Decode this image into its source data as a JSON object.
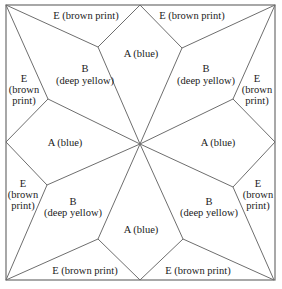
{
  "diagram": {
    "pieces": {
      "A": {
        "letter": "A",
        "color_name": "blue"
      },
      "B": {
        "letter": "B",
        "color_name": "deep yellow"
      },
      "E": {
        "letter": "E",
        "color_name": "brown print"
      }
    },
    "labels": {
      "e_top_left": "E (brown print)",
      "e_top_right": "E (brown print)",
      "a_top": "A (blue)",
      "b_top_left_letter": "B",
      "b_top_left_color": "(deep yellow)",
      "b_top_right_letter": "B",
      "b_top_right_color": "(deep yellow)",
      "e_left_top_letter": "E",
      "e_left_top_l1": "(brown",
      "e_left_top_l2": "print)",
      "e_right_top_letter": "E",
      "e_right_top_l1": "(brown",
      "e_right_top_l2": "print)",
      "a_left": "A (blue)",
      "a_right": "A (blue)",
      "e_left_bottom_letter": "E",
      "e_left_bottom_l1": "(brown",
      "e_left_bottom_l2": "print)",
      "e_right_bottom_letter": "E",
      "e_right_bottom_l1": "(brown",
      "e_right_bottom_l2": "print)",
      "b_bottom_left_letter": "B",
      "b_bottom_left_color": "(deep yellow)",
      "b_bottom_right_letter": "B",
      "b_bottom_right_color": "(deep yellow)",
      "a_bottom": "A (blue)",
      "e_bottom_left": "E (brown print)",
      "e_bottom_right": "E (brown print)"
    }
  }
}
